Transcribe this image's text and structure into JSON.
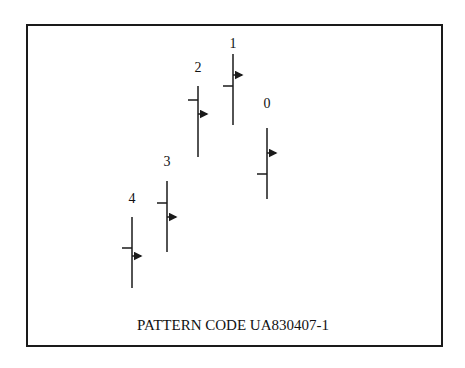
{
  "chart_data": {
    "type": "ohlc",
    "title": "",
    "caption": "PATTERN CODE UA830407-1",
    "categories": [
      "4",
      "3",
      "2",
      "1",
      "0"
    ],
    "bars": [
      {
        "label": "4",
        "high": 217,
        "low": 288,
        "open": 248,
        "close": 256,
        "x": 132,
        "label_y": 203
      },
      {
        "label": "3",
        "high": 181,
        "low": 252,
        "open": 203,
        "close": 217,
        "x": 167,
        "label_y": 166
      },
      {
        "label": "2",
        "high": 86,
        "low": 157,
        "open": 100,
        "close": 114,
        "x": 198,
        "label_y": 72
      },
      {
        "label": "1",
        "high": 54,
        "low": 125,
        "open": 86,
        "close": 75,
        "x": 233,
        "label_y": 48
      },
      {
        "label": "0",
        "high": 128,
        "low": 199,
        "open": 174,
        "close": 153,
        "x": 267,
        "label_y": 108
      }
    ],
    "note": "values are pixel y-coordinates (no axes shown); open = left tick, close = right arrow",
    "grid": false,
    "legend": null
  },
  "colors": {
    "line": "#1a1a1a",
    "background": "#ffffff"
  }
}
